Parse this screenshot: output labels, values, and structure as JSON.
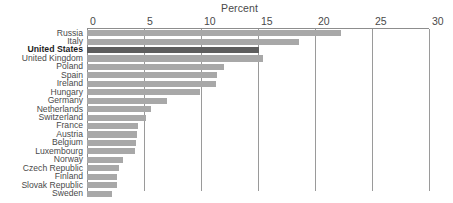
{
  "chart_data": {
    "type": "bar",
    "orientation": "horizontal",
    "title": "Percent",
    "xlabel": "",
    "ylabel": "",
    "xlim": [
      0,
      30
    ],
    "xticks": [
      0,
      5,
      10,
      15,
      20,
      25,
      30
    ],
    "xtick_labels": [
      "0",
      "5",
      "10",
      "15",
      "20",
      "25",
      "30"
    ],
    "grid": true,
    "legend": null,
    "categories": [
      "Russia",
      "Italy",
      "United States",
      "United Kingdom",
      "Poland",
      "Spain",
      "Ireland",
      "Hungary",
      "Germany",
      "Netherlands",
      "Switzerland",
      "France",
      "Austria",
      "Belgium",
      "Luxembourg",
      "Norway",
      "Czech Republic",
      "Finland",
      "Slovak Republic",
      "Sweden"
    ],
    "values": [
      22.3,
      18.6,
      15.1,
      15.4,
      12.0,
      11.4,
      11.3,
      9.9,
      7.0,
      5.6,
      5.2,
      4.5,
      4.4,
      4.3,
      4.2,
      3.2,
      2.8,
      2.6,
      2.6,
      2.2
    ],
    "highlight_category": "United States",
    "colors": {
      "bar": "#a8a8a8",
      "bar_highlight": "#5e5e5e",
      "gridline": "#9a9a9a",
      "axis": "#8d8d8d",
      "text": "#4a4a4a",
      "text_highlight": "#1d1d1d",
      "background": "#ffffff"
    }
  }
}
